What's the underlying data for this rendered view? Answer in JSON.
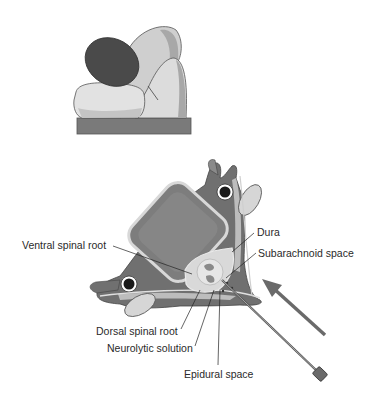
{
  "figure": {
    "top_panel": {
      "description": "patient positioning illustration",
      "colors": {
        "head": "#4a4a4a",
        "body_light": "#d9d9d9",
        "body_mid": "#bdbdbd",
        "table": "#7a7a7a"
      }
    },
    "bottom_panel": {
      "description": "vertebral cross-section with needle insertion",
      "labels": {
        "ventral_spinal_root": "Ventral spinal root",
        "dura": "Dura",
        "subarachnoid_space": "Subarachnoid space",
        "dorsal_spinal_root": "Dorsal spinal root",
        "neurolytic_solution": "Neurolytic solution",
        "epidural_space": "Epidural space"
      },
      "colors": {
        "bone_dark": "#6f6f6f",
        "bone_body": "#7d7d7d",
        "bone_light": "#c8c8c8",
        "arrow": "#6a6a6a",
        "vessel": "#1a1a1a"
      }
    }
  }
}
